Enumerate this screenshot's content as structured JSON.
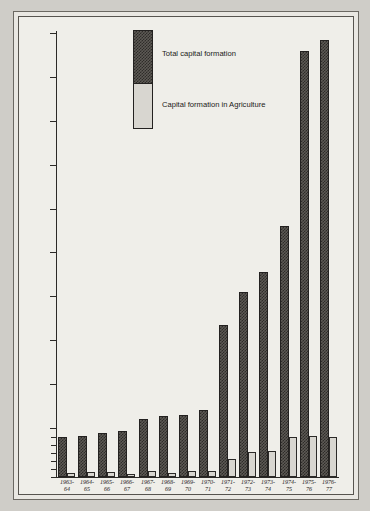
{
  "chart_data": {
    "type": "bar",
    "title": "",
    "xlabel": "",
    "ylabel": "",
    "ylim": [
      0,
      1000
    ],
    "grid": false,
    "legend_position": "inside-top-center",
    "note": "Y axis uses a broken/expanded scale: 0-50 region is magnified with minor ticks at 10,20,30,40,50; above that major ticks every 100 up to 1000.",
    "categories": [
      "1963-64",
      "1964-65",
      "1965-66",
      "1966-67",
      "1967-68",
      "1968-69",
      "1969-70",
      "1970-71",
      "1971-72",
      "1972-73",
      "1973-74",
      "1974-75",
      "1975-76",
      "1976-77"
    ],
    "category_lines": [
      [
        "1963-",
        "64"
      ],
      [
        "1964-",
        "65"
      ],
      [
        "1965-",
        "66"
      ],
      [
        "1966-",
        "67"
      ],
      [
        "1967-",
        "68"
      ],
      [
        "1968-",
        "69"
      ],
      [
        "1969-",
        "70"
      ],
      [
        "1970-",
        "71"
      ],
      [
        "1971-",
        "72"
      ],
      [
        "1972-",
        "73"
      ],
      [
        "1973-",
        "74"
      ],
      [
        "1974-",
        "75"
      ],
      [
        "1975-",
        "76"
      ],
      [
        "1976-",
        "77"
      ]
    ],
    "series": [
      {
        "name": "Total capital formation",
        "color": "#3a3835",
        "values": [
          50,
          57,
          75,
          83,
          120,
          128,
          130,
          140,
          335,
          410,
          455,
          560,
          960,
          985
        ]
      },
      {
        "name": "Capital formation in Agriculture",
        "color": "#d8d6d0",
        "values": [
          5,
          6,
          6,
          4,
          7,
          5,
          8,
          7,
          22,
          31,
          33,
          51,
          53,
          51
        ]
      }
    ],
    "y_major_ticks": [
      100,
      200,
      300,
      400,
      500,
      600,
      700,
      800,
      900,
      1000
    ],
    "y_minor_ticks": [
      0,
      10,
      20,
      30,
      40,
      50
    ],
    "y_tick_labels": [
      "0",
      "10",
      "20",
      "30",
      "40",
      "50",
      "100",
      "200",
      "300",
      "400",
      "500",
      "600",
      "700",
      "800",
      "900",
      "1000"
    ]
  },
  "legend": {
    "items": [
      {
        "label": "Total capital formation"
      },
      {
        "label": "Capital formation in Agriculture"
      }
    ]
  }
}
